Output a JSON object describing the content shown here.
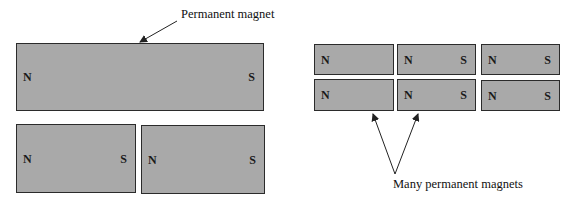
{
  "labels": {
    "single": "Permanent magnet",
    "many": "Many permanent magnets"
  },
  "colors": {
    "magnet_fill": "#a9a9a9",
    "magnet_border": "#2b2b2b",
    "arrow": "#222222"
  },
  "left_diagram": {
    "big_magnet": {
      "north": "N",
      "south": "S"
    },
    "split_magnets": [
      {
        "north": "N",
        "south": "S"
      },
      {
        "north": "N",
        "south": "S"
      }
    ]
  },
  "right_diagram": {
    "grid": [
      [
        {
          "north": "N",
          "south": ""
        },
        {
          "north": "N",
          "south": "S"
        },
        {
          "north": "N",
          "south": "S"
        }
      ],
      [
        {
          "north": "N",
          "south": ""
        },
        {
          "north": "N",
          "south": "S"
        },
        {
          "north": "N",
          "south": "S"
        }
      ]
    ]
  }
}
